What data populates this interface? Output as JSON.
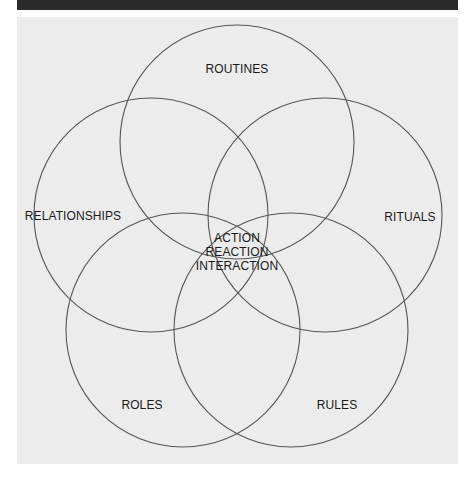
{
  "diagram": {
    "type": "five-circle-venn",
    "colors": {
      "panel_background": "#ececec",
      "top_bar": "#2b2b2b",
      "circle_stroke": "#555555",
      "text": "#1a1a1a"
    },
    "circles": [
      {
        "id": "routines",
        "label": "ROUTINES",
        "cx": 237,
        "cy": 142,
        "r": 117,
        "label_x": 237,
        "label_y": 69
      },
      {
        "id": "relationships",
        "label": "RELATIONSHIPS",
        "cx": 151,
        "cy": 215,
        "r": 117,
        "label_x": 73,
        "label_y": 216
      },
      {
        "id": "rituals",
        "label": "RITUALS",
        "cx": 325,
        "cy": 215,
        "r": 117,
        "label_x": 410,
        "label_y": 217
      },
      {
        "id": "roles",
        "label": "ROLES",
        "cx": 183,
        "cy": 330,
        "r": 117,
        "label_x": 142,
        "label_y": 405
      },
      {
        "id": "rules",
        "label": "RULES",
        "cx": 291,
        "cy": 330,
        "r": 117,
        "label_x": 337,
        "label_y": 405
      }
    ],
    "center": {
      "lines": [
        "ACTION",
        "REACTION",
        "INTERACTION"
      ],
      "x": 237,
      "y": 252
    }
  }
}
